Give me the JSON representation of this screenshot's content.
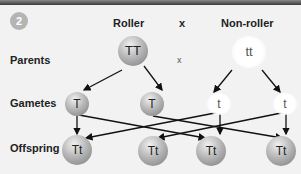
{
  "step_number": "2",
  "headers": {
    "left": "Roller",
    "cross": "x",
    "right": "Non-roller"
  },
  "rows": {
    "parents": "Parents",
    "gametes": "Gametes",
    "offspring": "Offspring"
  },
  "parents": {
    "left": "TT",
    "cross": "x",
    "right": "tt"
  },
  "gametes": [
    "T",
    "T",
    "t",
    "t"
  ],
  "offspring": [
    "Tt",
    "Tt",
    "Tt",
    "Tt"
  ]
}
